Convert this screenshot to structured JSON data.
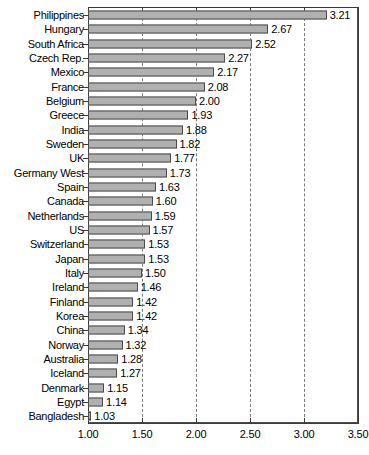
{
  "chart_data": {
    "type": "bar",
    "orientation": "horizontal",
    "title": "",
    "subtitle": "",
    "xlabel": "",
    "ylabel": "",
    "xlim": [
      1.0,
      3.5
    ],
    "xticks": [
      "1.00",
      "1.50",
      "2.00",
      "2.50",
      "3.00",
      "3.50"
    ],
    "xtick_values": [
      1.0,
      1.5,
      2.0,
      2.5,
      3.0,
      3.5
    ],
    "grid": true,
    "grid_axis": "x",
    "grid_style": "dashed",
    "legend": "none",
    "bar_color": "#b0b0b0",
    "bar_edge_color": "#4a4a4a",
    "axis_color": "#3a3a3a",
    "categories": [
      "Philippines",
      "Hungary",
      "South Africa",
      "Czech Rep.",
      "Mexico",
      "France",
      "Belgium",
      "Greece",
      "India",
      "Sweden",
      "UK",
      "Germany West",
      "Spain",
      "Canada",
      "Netherlands",
      "US",
      "Switzerland",
      "Japan",
      "Italy",
      "Ireland",
      "Finland",
      "Korea",
      "China",
      "Norway",
      "Australia",
      "Iceland",
      "Denmark",
      "Egypt",
      "Bangladesh"
    ],
    "values": [
      3.21,
      2.67,
      2.52,
      2.27,
      2.17,
      2.08,
      2.0,
      1.93,
      1.88,
      1.82,
      1.77,
      1.73,
      1.63,
      1.6,
      1.59,
      1.57,
      1.53,
      1.53,
      1.5,
      1.46,
      1.42,
      1.42,
      1.34,
      1.32,
      1.28,
      1.27,
      1.15,
      1.14,
      1.03
    ],
    "value_labels": [
      "3.21",
      "2.67",
      "2.52",
      "2.27",
      "2.17",
      "2.08",
      "2.00",
      "1.93",
      "1.88",
      "1.82",
      "1.77",
      "1.73",
      "1.63",
      "1.60",
      "1.59",
      "1.57",
      "1.53",
      "1.53",
      "1.50",
      "1.46",
      "1.42",
      "1.42",
      "1.34",
      "1.32",
      "1.28",
      "1.27",
      "1.15",
      "1.14",
      "1.03"
    ]
  }
}
